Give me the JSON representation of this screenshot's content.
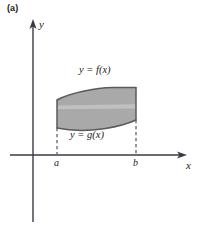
{
  "figure": {
    "panel_label": "(a)",
    "background_color": "#ffffff",
    "axis_color": "#3a3a46",
    "region_fill_color": "#a9a9a9",
    "region_stroke_color": "#5a5a5a",
    "highlight_band_color": "#c4c4c4",
    "dashed_line_color": "#555555"
  },
  "axes": {
    "x_axis_label": "x",
    "y_axis_label": "y",
    "x_axis_y_pixel": 155,
    "y_axis_x_pixel": 33,
    "x_axis_start": 10,
    "x_axis_end": 186,
    "y_axis_top": 20,
    "y_axis_bottom": 222
  },
  "ticks": [
    {
      "label": "a",
      "x_pixel": 57
    },
    {
      "label": "b",
      "x_pixel": 136
    }
  ],
  "curves": [
    {
      "name": "upper-curve",
      "label": "y = f(x)"
    },
    {
      "name": "lower-curve",
      "label": "y = g(x)"
    }
  ],
  "chart_data": {
    "type": "area",
    "title": "",
    "xlabel": "x",
    "ylabel": "y",
    "grid": false,
    "legend": "none",
    "annotations": [
      "(a)",
      "y = f(x)",
      "y = g(x)",
      "a",
      "b"
    ],
    "tick_labels": {
      "x": [
        "a",
        "b"
      ],
      "y": []
    },
    "series": [
      {
        "name": "y = f(x)",
        "x": [
          57,
          70,
          85,
          100,
          115,
          125,
          136
        ],
        "y": [
          100,
          95,
          91,
          89,
          88,
          87.5,
          87.5
        ]
      },
      {
        "name": "y = g(x)",
        "x": [
          57,
          70,
          85,
          100,
          115,
          125,
          136
        ],
        "y": [
          128,
          130,
          130.5,
          129,
          126,
          123,
          120
        ]
      }
    ],
    "boundaries": {
      "left_vertical_x": 57,
      "right_vertical_x": 136,
      "baseline_y": 155
    }
  }
}
